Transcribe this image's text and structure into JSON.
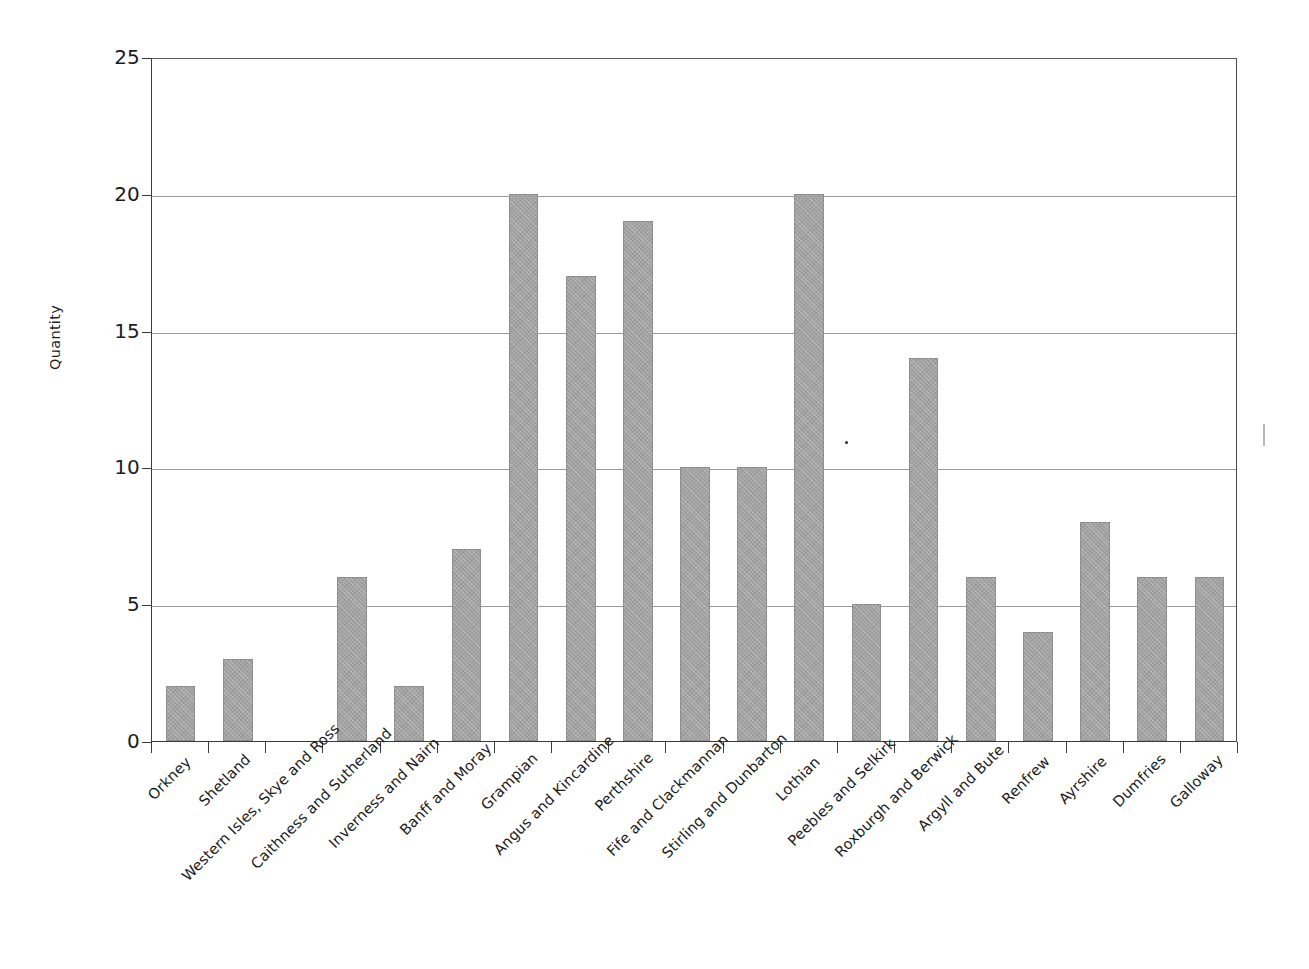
{
  "chart_data": {
    "type": "bar",
    "title": "",
    "xlabel": "",
    "ylabel": "Quantity",
    "ylim": [
      0,
      25
    ],
    "yticks": [
      0,
      5,
      10,
      15,
      20,
      25
    ],
    "grid": "horizontal",
    "legend": "none",
    "categories": [
      "Orkney",
      "Shetland",
      "Western Isles, Skye and Ross",
      "Caithness and Sutherland",
      "Inverness and Nairn",
      "Banff and Moray",
      "Grampian",
      "Angus and Kincardine",
      "Perthshire",
      "Fife and Clackmannan",
      "Stirling and Dunbarton",
      "Lothian",
      "Peebles and Selkirk",
      "Roxburgh and Berwick",
      "Argyll and Bute",
      "Renfrew",
      "Ayrshire",
      "Dumfries",
      "Galloway"
    ],
    "values": [
      2,
      3,
      0,
      6,
      2,
      7,
      20,
      17,
      19,
      10,
      10,
      20,
      5,
      14,
      6,
      4,
      8,
      6,
      6
    ],
    "bar_color": "#a2a2a2",
    "axis_color": "#3a3a3a",
    "gridline_color": "#9a9a9a"
  },
  "axes": {
    "y_tick_labels": [
      "0",
      "5",
      "10",
      "15",
      "20",
      "25"
    ],
    "y_axis_title": "Quantity"
  }
}
